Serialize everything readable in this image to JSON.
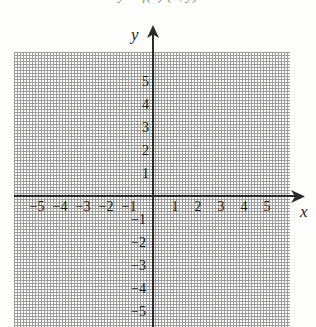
{
  "header": {
    "clipped_text": "y = f(x)          (x,  y)"
  },
  "axes": {
    "x_label": "x",
    "y_label": "y",
    "x_arrow_icon": "arrow-right-icon",
    "y_arrow_icon": "arrow-up-icon"
  },
  "chart_data": {
    "type": "scatter",
    "title": "",
    "subtitle": "",
    "xlabel": "x",
    "ylabel": "y",
    "xlim": [
      -6,
      6
    ],
    "ylim": [
      -6,
      6
    ],
    "grid": true,
    "minor_grid": true,
    "major_step": 1,
    "minor_per_major": 4,
    "legend": "none",
    "series": [],
    "x_ticks": [
      -5,
      -4,
      -3,
      -2,
      -1,
      1,
      2,
      3,
      4,
      5
    ],
    "y_ticks": [
      5,
      4,
      3,
      2,
      1,
      -1,
      -2,
      -3,
      -4,
      -5
    ],
    "x_tick_labels": [
      "−5",
      "−4",
      "−3",
      "−2",
      "−1",
      "1",
      "2",
      "3",
      "4",
      "5"
    ],
    "y_tick_labels": [
      "5",
      "4",
      "3",
      "2",
      "1",
      "−1",
      "−2",
      "−3",
      "−4",
      "−5"
    ]
  },
  "ticks": {
    "x_negative": [
      {
        "label": "−5",
        "value": -5
      },
      {
        "label": "−4",
        "value": -4
      },
      {
        "label": "−3",
        "value": -3
      },
      {
        "label": "−2",
        "value": -2
      },
      {
        "label": "−1",
        "value": -1
      }
    ],
    "x_positive": [
      {
        "label": "1",
        "value": 1
      },
      {
        "label": "2",
        "value": 2
      },
      {
        "label": "3",
        "value": 3
      },
      {
        "label": "4",
        "value": 4
      },
      {
        "label": "5",
        "value": 5
      }
    ],
    "y_positive": [
      {
        "label": "5",
        "value": 5
      },
      {
        "label": "4",
        "value": 4
      },
      {
        "label": "3",
        "value": 3
      },
      {
        "label": "2",
        "value": 2
      },
      {
        "label": "1",
        "value": 1
      }
    ],
    "y_negative": [
      {
        "label": "−1",
        "value": -1
      },
      {
        "label": "−2",
        "value": -2
      },
      {
        "label": "−3",
        "value": -3
      },
      {
        "label": "−4",
        "value": -4
      },
      {
        "label": "−5",
        "value": -5
      }
    ]
  },
  "colors": {
    "background": "#fdfdfb",
    "axis": "#2b2b2b",
    "grid_major": "#a9a9a9",
    "grid_minor": "#dedede",
    "text": "#1a1a1a"
  }
}
